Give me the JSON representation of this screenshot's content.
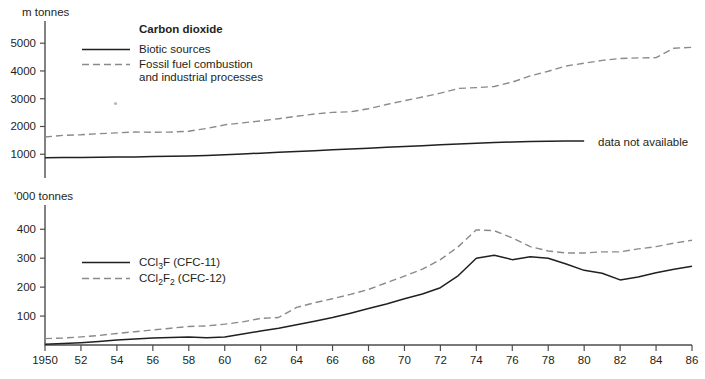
{
  "figure": {
    "background": "#ffffff",
    "ink_color": "#231f20",
    "dashed_color": "#8a8a8a"
  },
  "panels": [
    {
      "id": "carbon-dioxide",
      "unit_label": "m tonnes",
      "legend_title": "Carbon dioxide",
      "legend": [
        {
          "style": "solid",
          "label": "Biotic sources"
        },
        {
          "style": "dashed",
          "label": "Fossil fuel combustion",
          "label2": "and industrial processes"
        }
      ],
      "annotation": "data not available",
      "yticks": [
        1000,
        2000,
        3000,
        4000,
        5000
      ],
      "ylim": [
        0,
        5800
      ]
    },
    {
      "id": "cfc",
      "unit_label": "'000 tonnes",
      "legend": [
        {
          "style": "solid",
          "label_parts": [
            "CCl",
            "3",
            "F (CFC-11)"
          ]
        },
        {
          "style": "dashed",
          "label_parts": [
            "CCl",
            "2",
            "F",
            "2",
            " (CFC-12)"
          ]
        }
      ],
      "yticks": [
        100,
        200,
        300,
        400
      ],
      "ylim": [
        0,
        470
      ]
    }
  ],
  "xaxis": {
    "xlim": [
      1950,
      1986
    ],
    "tick_years": [
      1950,
      1952,
      1954,
      1956,
      1958,
      1960,
      1962,
      1964,
      1966,
      1968,
      1970,
      1972,
      1974,
      1976,
      1978,
      1980,
      1982,
      1984,
      1986
    ],
    "tick_labels": [
      "1950",
      "52",
      "54",
      "56",
      "58",
      "60",
      "62",
      "64",
      "66",
      "68",
      "70",
      "72",
      "74",
      "76",
      "78",
      "80",
      "82",
      "84",
      "86"
    ]
  },
  "chart_data": [
    {
      "type": "line",
      "title": "Carbon dioxide",
      "xlabel": "",
      "ylabel": "m tonnes",
      "xlim": [
        1950,
        1986
      ],
      "ylim": [
        0,
        5800
      ],
      "grid": false,
      "legend_position": "inside-top-left",
      "annotations": [
        "data not available"
      ],
      "x": [
        1950,
        1951,
        1952,
        1953,
        1954,
        1955,
        1956,
        1957,
        1958,
        1959,
        1960,
        1961,
        1962,
        1963,
        1964,
        1965,
        1966,
        1967,
        1968,
        1969,
        1970,
        1971,
        1972,
        1973,
        1974,
        1975,
        1976,
        1977,
        1978,
        1979,
        1980,
        1981,
        1982,
        1983,
        1984,
        1985,
        1986
      ],
      "series": [
        {
          "name": "Biotic sources",
          "style": "solid",
          "values": [
            870,
            880,
            885,
            890,
            900,
            905,
            915,
            925,
            940,
            955,
            980,
            1010,
            1040,
            1070,
            1100,
            1130,
            1160,
            1190,
            1220,
            1250,
            1280,
            1310,
            1340,
            1370,
            1400,
            1420,
            1440,
            1455,
            1465,
            1475,
            1480,
            null,
            null,
            null,
            null,
            null,
            null
          ],
          "note": "data not available after 1980"
        },
        {
          "name": "Fossil fuel combustion and industrial processes",
          "style": "dashed",
          "values": [
            1620,
            1680,
            1700,
            1740,
            1770,
            1800,
            1790,
            1800,
            1830,
            1930,
            2060,
            2130,
            2200,
            2280,
            2370,
            2450,
            2510,
            2530,
            2640,
            2790,
            2930,
            3060,
            3200,
            3370,
            3400,
            3440,
            3600,
            3820,
            3990,
            4180,
            4280,
            4380,
            4450,
            4470,
            4480,
            4820,
            4850
          ]
        }
      ]
    },
    {
      "type": "line",
      "title": "CFCs",
      "xlabel": "",
      "ylabel": "'000 tonnes",
      "xlim": [
        1950,
        1986
      ],
      "ylim": [
        0,
        470
      ],
      "grid": false,
      "legend_position": "inside-left",
      "x": [
        1950,
        1951,
        1952,
        1953,
        1954,
        1955,
        1956,
        1957,
        1958,
        1959,
        1960,
        1961,
        1962,
        1963,
        1964,
        1965,
        1966,
        1967,
        1968,
        1969,
        1970,
        1971,
        1972,
        1973,
        1974,
        1975,
        1976,
        1977,
        1978,
        1979,
        1980,
        1981,
        1982,
        1983,
        1984,
        1985,
        1986
      ],
      "series": [
        {
          "name": "CCl3F (CFC-11)",
          "style": "solid",
          "values": [
            3,
            5,
            8,
            12,
            17,
            21,
            24,
            26,
            28,
            25,
            28,
            38,
            48,
            58,
            70,
            82,
            95,
            110,
            126,
            142,
            160,
            176,
            198,
            240,
            300,
            310,
            295,
            305,
            300,
            280,
            258,
            248,
            225,
            235,
            250,
            262,
            272
          ]
        },
        {
          "name": "CCl2F2 (CFC-12)",
          "style": "dashed",
          "values": [
            22,
            24,
            28,
            33,
            40,
            46,
            52,
            58,
            64,
            66,
            72,
            80,
            92,
            95,
            130,
            146,
            160,
            175,
            192,
            215,
            238,
            262,
            295,
            340,
            398,
            395,
            370,
            340,
            325,
            318,
            318,
            322,
            322,
            332,
            340,
            352,
            362
          ]
        }
      ]
    }
  ]
}
